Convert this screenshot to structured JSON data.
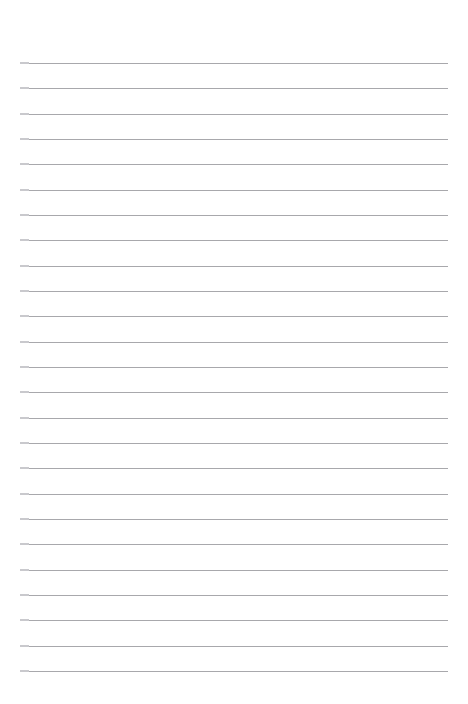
{
  "page": {
    "kind": "lined-paper-sheet",
    "width": 468,
    "height": 704,
    "background_color": "#ffffff",
    "content_text": "",
    "has_text": false,
    "has_margin_rule": false,
    "has_header": false,
    "has_page_number": false
  },
  "rules": {
    "count": 25,
    "color": "#a8a8ac",
    "thickness_px": 1,
    "left_x": 20,
    "right_x": 448,
    "length_px": 428,
    "first_line_y": 63,
    "spacing_px": 25.33,
    "top_margin_px": 63,
    "bottom_margin_px": 33,
    "left_margin_px": 20,
    "right_margin_px": 20,
    "line_positions_y": [
      63,
      88,
      114,
      139,
      164,
      190,
      215,
      240,
      266,
      291,
      316,
      342,
      367,
      392,
      418,
      443,
      468,
      494,
      519,
      544,
      570,
      595,
      620,
      646,
      671
    ]
  }
}
